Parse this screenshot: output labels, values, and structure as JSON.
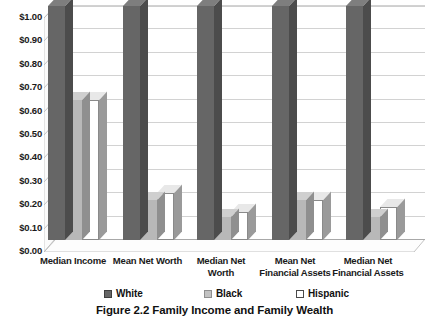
{
  "caption": "Figure 2.2  Family Income and Family Wealth",
  "axis": {
    "y_ticks": [
      "$1.00",
      "$0.90",
      "$0.80",
      "$0.70",
      "$0.60",
      "$0.50",
      "$0.40",
      "$0.30",
      "$0.20",
      "$0.10",
      "$0.00"
    ]
  },
  "legend": {
    "items": [
      {
        "label": "White",
        "swatch": "dark-gray-swatch",
        "color": "#666666"
      },
      {
        "label": "Black",
        "swatch": "light-gray-swatch",
        "color": "#c2c2c2"
      },
      {
        "label": "Hispanic",
        "swatch": "white-swatch",
        "color": "#ffffff"
      }
    ]
  },
  "chart_data": {
    "type": "bar",
    "title": "Figure 2.2  Family Income and Family Wealth",
    "xlabel": "",
    "ylabel": "",
    "ylim": [
      0,
      1.0
    ],
    "ytick_step": 0.1,
    "ytick_format": "$0.00",
    "grid": true,
    "legend_position": "bottom",
    "style": "3d-clustered-column",
    "categories": [
      "Median Income",
      "Mean Net Worth",
      "Median Net Worth",
      "Mean Net Financial Assets",
      "Median Net Financial Assets"
    ],
    "series": [
      {
        "name": "White",
        "values": [
          1.0,
          1.0,
          1.0,
          1.0,
          1.0
        ]
      },
      {
        "name": "Black",
        "values": [
          0.6,
          0.17,
          0.1,
          0.17,
          0.1
        ]
      },
      {
        "name": "Hispanic",
        "values": [
          0.6,
          0.2,
          0.12,
          0.17,
          0.14
        ]
      }
    ]
  }
}
